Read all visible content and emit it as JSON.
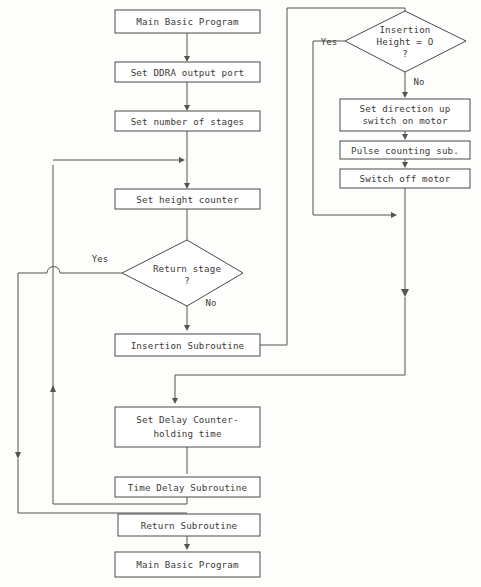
{
  "diagram": {
    "type": "flowchart",
    "colors": {
      "background": "#fdfdfc",
      "node_fill": "#ffffff",
      "node_stroke": "#4a4a46",
      "connector": "#55534e",
      "text": "#3b3a36"
    },
    "nodes": [
      {
        "id": "main_top",
        "shape": "process",
        "line1": "Main Basic Program",
        "line2": ""
      },
      {
        "id": "set_ddra",
        "shape": "process",
        "line1": "Set DDRA output port",
        "line2": ""
      },
      {
        "id": "set_stages",
        "shape": "process",
        "line1": "Set number of stages",
        "line2": ""
      },
      {
        "id": "set_height",
        "shape": "process",
        "line1": "Set height counter",
        "line2": ""
      },
      {
        "id": "return_stage",
        "shape": "decision",
        "line1": "Return stage",
        "line2": "?"
      },
      {
        "id": "insertion_sub",
        "shape": "process",
        "line1": "Insertion Subroutine",
        "line2": ""
      },
      {
        "id": "set_delay",
        "shape": "process",
        "line1": "Set Delay Counter-",
        "line2": "holding time"
      },
      {
        "id": "time_delay_sub",
        "shape": "process",
        "line1": "Time Delay Subroutine",
        "line2": ""
      },
      {
        "id": "return_sub",
        "shape": "process",
        "line1": "Return Subroutine",
        "line2": ""
      },
      {
        "id": "main_bottom",
        "shape": "process",
        "line1": "Main Basic Program",
        "line2": ""
      },
      {
        "id": "insertion_height",
        "shape": "decision",
        "line1": "Insertion",
        "line2": "Height = O",
        "line3": "?"
      },
      {
        "id": "set_direction",
        "shape": "process",
        "line1": "Set direction up",
        "line2": "switch on motor"
      },
      {
        "id": "pulse_count",
        "shape": "process",
        "line1": "Pulse counting sub.",
        "line2": ""
      },
      {
        "id": "switch_off",
        "shape": "process",
        "line1": "Switch off motor",
        "line2": ""
      }
    ],
    "edge_labels": {
      "return_stage_yes": "Yes",
      "return_stage_no": "No",
      "insertion_height_yes": "Yes",
      "insertion_height_no": "No"
    }
  }
}
